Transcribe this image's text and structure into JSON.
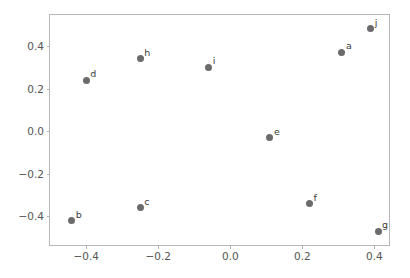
{
  "chart_data": {
    "type": "scatter",
    "title": "",
    "xlabel": "",
    "ylabel": "",
    "xlim": [
      -0.5005,
      0.4405
    ],
    "ylim": [
      -0.5345,
      0.5455
    ],
    "grid": false,
    "legend": "none",
    "marker_color": "#6b6b6b",
    "marker_size": 7,
    "label_color": "#3a3a3a",
    "axis_color": "#b8b8b8",
    "tick_label_color": "#545454",
    "xticks": [
      -0.4,
      -0.2,
      0.0,
      0.2,
      0.4
    ],
    "xticklabels": [
      "−0.4",
      "−0.2",
      "0.0",
      "0.2",
      "0.4"
    ],
    "yticks": [
      0.4,
      0.2,
      0.0,
      -0.2,
      -0.4
    ],
    "yticklabels": [
      "0.4",
      "0.2",
      "0.0",
      "−0.2",
      "−0.4"
    ],
    "points": [
      {
        "label": "a",
        "x": 0.31,
        "y": 0.37
      },
      {
        "label": "b",
        "x": -0.44,
        "y": -0.42
      },
      {
        "label": "c",
        "x": -0.25,
        "y": -0.36
      },
      {
        "label": "d",
        "x": -0.4,
        "y": 0.24
      },
      {
        "label": "e",
        "x": 0.11,
        "y": -0.03
      },
      {
        "label": "f",
        "x": 0.22,
        "y": -0.34
      },
      {
        "label": "g",
        "x": 0.41,
        "y": -0.47
      },
      {
        "label": "h",
        "x": -0.25,
        "y": 0.34
      },
      {
        "label": "i",
        "x": -0.06,
        "y": 0.3
      },
      {
        "label": "j",
        "x": 0.39,
        "y": 0.48
      }
    ]
  }
}
